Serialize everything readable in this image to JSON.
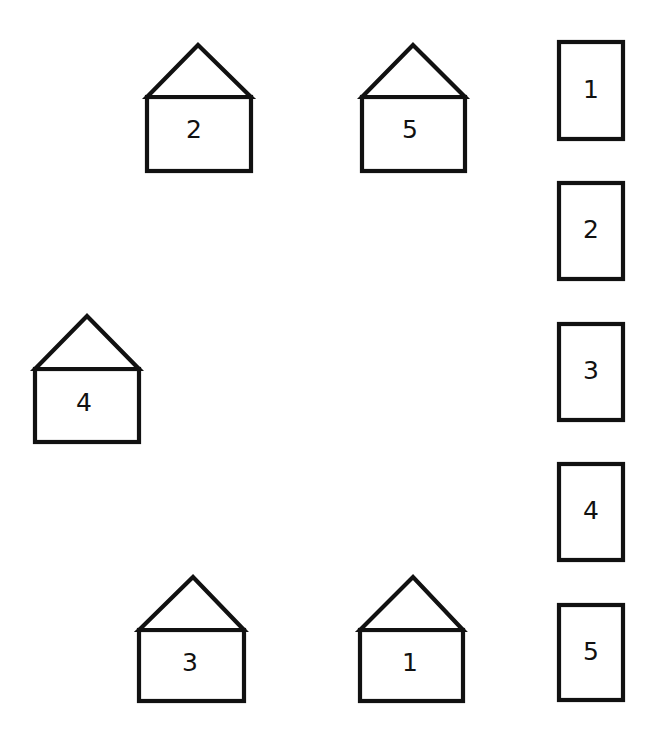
{
  "diagram": {
    "background_color": "#ffffff",
    "stroke_color": "#111111",
    "stroke_width": 4.2,
    "width": 656,
    "height": 735
  },
  "houses": [
    {
      "label": "2",
      "position": "top-left",
      "box": {
        "x": 147,
        "y": 97,
        "w": 104,
        "h": 74
      },
      "roof": {
        "apex_x": 198,
        "apex_y": 45,
        "left_x": 147,
        "right_x": 251,
        "base_y": 97
      },
      "label_x": 194,
      "label_y": 131
    },
    {
      "label": "5",
      "position": "top-right",
      "box": {
        "x": 362,
        "y": 97,
        "w": 103,
        "h": 74
      },
      "roof": {
        "apex_x": 413,
        "apex_y": 45,
        "left_x": 362,
        "right_x": 465,
        "base_y": 97
      },
      "label_x": 410,
      "label_y": 131
    },
    {
      "label": "4",
      "position": "middle-left",
      "box": {
        "x": 35,
        "y": 369,
        "w": 104,
        "h": 73
      },
      "roof": {
        "apex_x": 87,
        "apex_y": 316,
        "left_x": 35,
        "right_x": 139,
        "base_y": 369
      },
      "label_x": 84,
      "label_y": 404
    },
    {
      "label": "3",
      "position": "bottom-left",
      "box": {
        "x": 139,
        "y": 630,
        "w": 105,
        "h": 71
      },
      "roof": {
        "apex_x": 193,
        "apex_y": 577,
        "left_x": 139,
        "right_x": 244,
        "base_y": 630
      },
      "label_x": 190,
      "label_y": 664
    },
    {
      "label": "1",
      "position": "bottom-right",
      "box": {
        "x": 360,
        "y": 630,
        "w": 103,
        "h": 71
      },
      "roof": {
        "apex_x": 413,
        "apex_y": 577,
        "left_x": 360,
        "right_x": 463,
        "base_y": 630
      },
      "label_x": 410,
      "label_y": 664
    }
  ],
  "cards": [
    {
      "label": "1",
      "x": 559,
      "y": 42,
      "w": 64,
      "h": 97,
      "label_x": 591,
      "label_y": 91
    },
    {
      "label": "2",
      "x": 559,
      "y": 183,
      "w": 64,
      "h": 96,
      "label_x": 591,
      "label_y": 231
    },
    {
      "label": "3",
      "x": 559,
      "y": 324,
      "w": 64,
      "h": 96,
      "label_x": 591,
      "label_y": 372
    },
    {
      "label": "4",
      "x": 559,
      "y": 464,
      "w": 64,
      "h": 96,
      "label_x": 591,
      "label_y": 512
    },
    {
      "label": "5",
      "x": 559,
      "y": 605,
      "w": 64,
      "h": 95,
      "label_x": 591,
      "label_y": 653
    }
  ]
}
